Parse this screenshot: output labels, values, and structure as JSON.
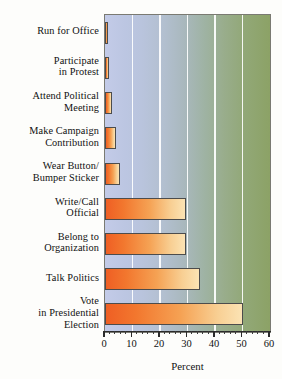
{
  "chart_data": {
    "type": "bar",
    "orientation": "horizontal",
    "title": "",
    "xlabel": "Percent",
    "ylabel": "",
    "xlim": [
      0,
      60
    ],
    "xticks": [
      0,
      10,
      20,
      30,
      40,
      50,
      60
    ],
    "xtick_labels": [
      "0",
      "10",
      "20",
      "30",
      "40",
      "50",
      "60"
    ],
    "minor_tick_step": 2,
    "grid": "vertical-major",
    "legend": "none",
    "categories": [
      "Run for Office",
      "Participate\nin Protest",
      "Attend Political\nMeeting",
      "Make Campaign\nContribution",
      "Wear Button/\nBumper Sticker",
      "Write/Call\nOfficial",
      "Belong to\nOrganization",
      "Talk Politics",
      "Vote\nin Presidential\nElection"
    ],
    "values": [
      1,
      1.5,
      2.5,
      4,
      5.5,
      29.5,
      29.5,
      34.5,
      50
    ],
    "colors": {
      "bar_start": "#ef5f24",
      "bar_end": "#fbe3b4",
      "bar_border": "#4c4c4c",
      "plot_bg_left": "#c3cbe8",
      "plot_bg_right": "#8ca266",
      "gridline": "#ffffff",
      "axis": "#2a2a2a",
      "text": "#111111",
      "page_bg": "#fdfdfb"
    }
  }
}
